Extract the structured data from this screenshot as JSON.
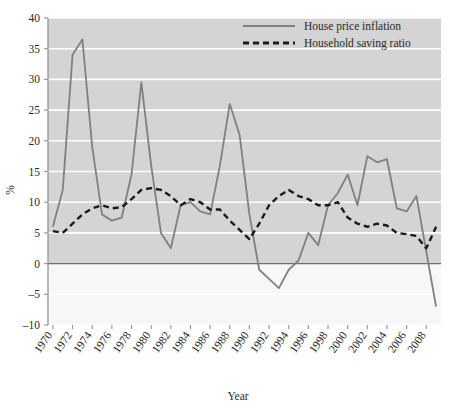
{
  "chart_data": {
    "type": "line",
    "title": "",
    "xlabel": "Year",
    "ylabel": "%",
    "xlim": [
      1969.5,
      2009.5
    ],
    "ylim": [
      -10,
      40
    ],
    "ytick_step": 5,
    "xtick_step": 2,
    "grid": "horizontal",
    "legend_position": "top-right",
    "plot_background": "#d4d4d4",
    "below_zero_background": "#f7f7f7",
    "gridline_color": "#ffffff",
    "zero_line_color": "#6e6e6e",
    "yticks": [
      -10,
      -5,
      0,
      5,
      10,
      15,
      20,
      25,
      30,
      35,
      40
    ],
    "ytick_labels": [
      "–10",
      "–5",
      "0",
      "5",
      "10",
      "15",
      "20",
      "25",
      "30",
      "35",
      "40"
    ],
    "xticks": [
      1970,
      1972,
      1974,
      1976,
      1978,
      1980,
      1982,
      1984,
      1986,
      1988,
      1990,
      1992,
      1994,
      1996,
      1998,
      2000,
      2002,
      2004,
      2006,
      2008
    ],
    "xtick_labels": [
      "1970",
      "1972",
      "1974",
      "1976",
      "1978",
      "1980",
      "1982",
      "1984",
      "1986",
      "1988",
      "1990",
      "1992",
      "1994",
      "1996",
      "1998",
      "2000",
      "2002",
      "2004",
      "2006",
      "2008"
    ],
    "x": [
      1970,
      1971,
      1972,
      1973,
      1974,
      1975,
      1976,
      1977,
      1978,
      1979,
      1980,
      1981,
      1982,
      1983,
      1984,
      1985,
      1986,
      1987,
      1988,
      1989,
      1990,
      1991,
      1992,
      1993,
      1994,
      1995,
      1996,
      1997,
      1998,
      1999,
      2000,
      2001,
      2002,
      2003,
      2004,
      2005,
      2006,
      2007,
      2008,
      2009
    ],
    "series": [
      {
        "name": "House price inflation",
        "style": "solid",
        "color": "#808080",
        "width": 1.8,
        "values": [
          6.0,
          12.0,
          34.0,
          36.5,
          19.0,
          8.0,
          7.0,
          7.5,
          14.5,
          29.5,
          16.0,
          5.0,
          2.5,
          9.5,
          10.0,
          8.5,
          8.0,
          16.0,
          26.0,
          21.0,
          8.0,
          -1.0,
          -2.5,
          -4.0,
          -1.0,
          0.5,
          5.0,
          3.0,
          9.5,
          11.5,
          14.5,
          9.5,
          17.5,
          16.5,
          17.0,
          9.0,
          8.5,
          11.0,
          2.0,
          -7.0
        ]
      },
      {
        "name": "Household saving ratio",
        "style": "dashed",
        "color": "#1a1a1a",
        "width": 2.4,
        "values": [
          5.3,
          5.0,
          6.5,
          8.0,
          9.0,
          9.5,
          9.0,
          9.2,
          10.5,
          12.0,
          12.3,
          12.0,
          11.0,
          9.5,
          10.5,
          10.0,
          8.8,
          8.8,
          7.0,
          5.5,
          4.0,
          6.5,
          9.5,
          11.0,
          12.0,
          11.0,
          10.5,
          9.5,
          9.5,
          10.0,
          7.5,
          6.5,
          6.0,
          6.5,
          6.2,
          5.0,
          4.8,
          4.5,
          2.5,
          6.0
        ]
      }
    ]
  },
  "legend": {
    "items": [
      {
        "label": "House price inflation",
        "style": "solid"
      },
      {
        "label": "Household saving ratio",
        "style": "dashed"
      }
    ]
  },
  "axes": {
    "x_title": "Year",
    "y_title": "%"
  }
}
